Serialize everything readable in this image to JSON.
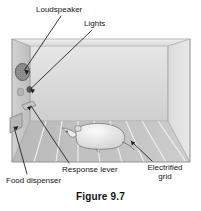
{
  "figure": {
    "caption": "Figure 9.7",
    "labels": [
      {
        "id": "loudspeaker",
        "text": "Loudspeaker"
      },
      {
        "id": "lights",
        "text": "Lights"
      },
      {
        "id": "response_lever",
        "text": "Response lever"
      },
      {
        "id": "food_dispenser",
        "text": "Food dispenser"
      },
      {
        "id": "electrified_grid_line1",
        "text": "Electrified"
      },
      {
        "id": "electrified_grid_line2",
        "text": "grid"
      }
    ]
  },
  "colors": {
    "background": "#ffffff",
    "ink": "#141414",
    "leader_line": "#2a2a2a",
    "box_left_wall": "#c9c9c9",
    "box_back_wall": "#d5d5d5",
    "box_floor": "#c2c2c2",
    "box_right_wall": "#dcdcdc",
    "box_top_rim": "#e4e4e4",
    "speaker_fill": "#8c8c8c",
    "speaker_stroke": "#4a4a4a",
    "light_fill": "#b0b0b0",
    "light_dark_fill": "#5a5a5a",
    "lever_fill": "#bdbdbd",
    "dispenser_fill": "#b5b5b5",
    "grid_line": "#f0f0f0",
    "rat_fill": "#ededed",
    "rat_stroke": "#6e6e6e"
  }
}
